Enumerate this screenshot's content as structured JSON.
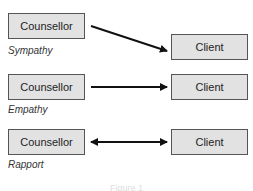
{
  "diagram": {
    "rows": [
      {
        "left": "Counsellor",
        "right": "Client",
        "label": "Sympathy",
        "arrow": "one-way-downward"
      },
      {
        "left": "Counsellor",
        "right": "Client",
        "label": "Empathy",
        "arrow": "one-way"
      },
      {
        "left": "Counsellor",
        "right": "Client",
        "label": "Rapport",
        "arrow": "two-way"
      }
    ],
    "caption": "Figure 1"
  }
}
